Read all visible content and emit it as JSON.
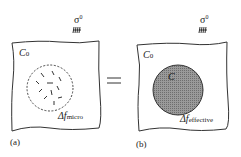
{
  "panel_a": {
    "label": "(a)",
    "medium": "C",
    "medium_sub": "0",
    "load": "σ",
    "load_sup": "0",
    "delta": "Δf",
    "delta_sub": "micro",
    "region": "dashed circle containing microcracks"
  },
  "panel_b": {
    "label": "(b)",
    "medium": "C",
    "medium_sub": "0",
    "inclusion": "C",
    "load": "σ",
    "load_sup": "0",
    "delta": "Δf",
    "delta_sub": "effective",
    "region": "shaded circle (effective medium)"
  },
  "relation": "=",
  "colors": {
    "line": "#333333",
    "fill": "#8a8a8a"
  }
}
